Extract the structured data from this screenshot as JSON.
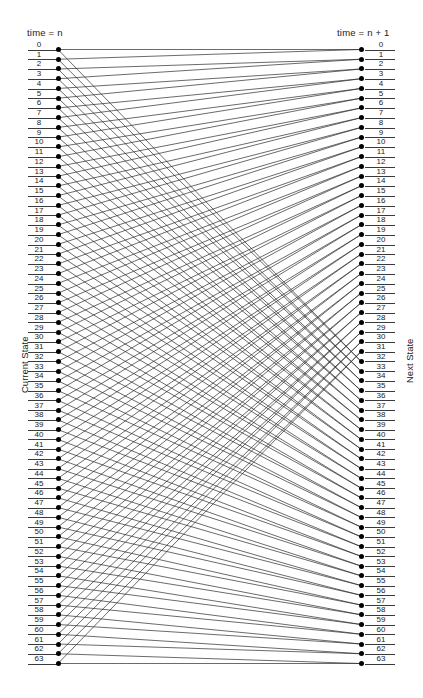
{
  "figure": {
    "headers": {
      "left": "time = n",
      "right": "time = n + 1"
    },
    "axis_titles": {
      "left": "Current State",
      "right": "Next State"
    },
    "footnote": ""
  },
  "chart_data": {
    "type": "diagram",
    "title": "",
    "subtitle": "",
    "xlabel": "",
    "ylabel": "Current State",
    "y2label": "Next State",
    "grid": false,
    "legend": null,
    "node_count": 64,
    "left_column_label": "time = n",
    "right_column_label": "time = n + 1",
    "left_tick_labels": [
      "0",
      "1",
      "2",
      "3",
      "4",
      "5",
      "6",
      "7",
      "8",
      "9",
      "10",
      "11",
      "12",
      "13",
      "14",
      "15",
      "16",
      "17",
      "18",
      "19",
      "20",
      "21",
      "22",
      "23",
      "24",
      "25",
      "26",
      "27",
      "28",
      "29",
      "30",
      "31",
      "32",
      "33",
      "34",
      "35",
      "36",
      "37",
      "38",
      "39",
      "40",
      "41",
      "42",
      "43",
      "44",
      "45",
      "46",
      "47",
      "48",
      "49",
      "50",
      "51",
      "52",
      "53",
      "54",
      "55",
      "56",
      "57",
      "58",
      "59",
      "60",
      "61",
      "62",
      "63"
    ],
    "right_tick_labels": [
      "0",
      "1",
      "2",
      "3",
      "4",
      "5",
      "6",
      "7",
      "8",
      "9",
      "10",
      "11",
      "12",
      "13",
      "14",
      "15",
      "16",
      "17",
      "18",
      "19",
      "20",
      "21",
      "22",
      "23",
      "24",
      "25",
      "26",
      "27",
      "28",
      "29",
      "30",
      "31",
      "32",
      "33",
      "34",
      "35",
      "36",
      "37",
      "38",
      "39",
      "40",
      "41",
      "42",
      "43",
      "44",
      "45",
      "46",
      "47",
      "48",
      "49",
      "50",
      "51",
      "52",
      "53",
      "54",
      "55",
      "56",
      "57",
      "58",
      "59",
      "60",
      "61",
      "62",
      "63"
    ],
    "edges_per_node": 2,
    "transition_rule": "next = floor(current / 2) and next = floor(current / 2) + 32",
    "edges": [
      [
        0,
        0
      ],
      [
        0,
        32
      ],
      [
        1,
        0
      ],
      [
        1,
        32
      ],
      [
        2,
        1
      ],
      [
        2,
        33
      ],
      [
        3,
        1
      ],
      [
        3,
        33
      ],
      [
        4,
        2
      ],
      [
        4,
        34
      ],
      [
        5,
        2
      ],
      [
        5,
        34
      ],
      [
        6,
        3
      ],
      [
        6,
        35
      ],
      [
        7,
        3
      ],
      [
        7,
        35
      ],
      [
        8,
        4
      ],
      [
        8,
        36
      ],
      [
        9,
        4
      ],
      [
        9,
        36
      ],
      [
        10,
        5
      ],
      [
        10,
        37
      ],
      [
        11,
        5
      ],
      [
        11,
        37
      ],
      [
        12,
        6
      ],
      [
        12,
        38
      ],
      [
        13,
        6
      ],
      [
        13,
        38
      ],
      [
        14,
        7
      ],
      [
        14,
        39
      ],
      [
        15,
        7
      ],
      [
        15,
        39
      ],
      [
        16,
        8
      ],
      [
        16,
        40
      ],
      [
        17,
        8
      ],
      [
        17,
        40
      ],
      [
        18,
        9
      ],
      [
        18,
        41
      ],
      [
        19,
        9
      ],
      [
        19,
        41
      ],
      [
        20,
        10
      ],
      [
        20,
        42
      ],
      [
        21,
        10
      ],
      [
        21,
        42
      ],
      [
        22,
        11
      ],
      [
        22,
        43
      ],
      [
        23,
        11
      ],
      [
        23,
        43
      ],
      [
        24,
        12
      ],
      [
        24,
        44
      ],
      [
        25,
        12
      ],
      [
        25,
        44
      ],
      [
        26,
        13
      ],
      [
        26,
        45
      ],
      [
        27,
        13
      ],
      [
        27,
        45
      ],
      [
        28,
        14
      ],
      [
        28,
        46
      ],
      [
        29,
        14
      ],
      [
        29,
        46
      ],
      [
        30,
        15
      ],
      [
        30,
        47
      ],
      [
        31,
        15
      ],
      [
        31,
        47
      ],
      [
        32,
        16
      ],
      [
        32,
        48
      ],
      [
        33,
        16
      ],
      [
        33,
        48
      ],
      [
        34,
        17
      ],
      [
        34,
        49
      ],
      [
        35,
        17
      ],
      [
        35,
        49
      ],
      [
        36,
        18
      ],
      [
        36,
        50
      ],
      [
        37,
        18
      ],
      [
        37,
        50
      ],
      [
        38,
        19
      ],
      [
        38,
        51
      ],
      [
        39,
        19
      ],
      [
        39,
        51
      ],
      [
        40,
        20
      ],
      [
        40,
        52
      ],
      [
        41,
        20
      ],
      [
        41,
        52
      ],
      [
        42,
        21
      ],
      [
        42,
        53
      ],
      [
        43,
        21
      ],
      [
        43,
        53
      ],
      [
        44,
        22
      ],
      [
        44,
        54
      ],
      [
        45,
        22
      ],
      [
        45,
        54
      ],
      [
        46,
        23
      ],
      [
        46,
        55
      ],
      [
        47,
        23
      ],
      [
        47,
        55
      ],
      [
        48,
        24
      ],
      [
        48,
        56
      ],
      [
        49,
        24
      ],
      [
        49,
        56
      ],
      [
        50,
        25
      ],
      [
        50,
        57
      ],
      [
        51,
        25
      ],
      [
        51,
        57
      ],
      [
        52,
        26
      ],
      [
        52,
        58
      ],
      [
        53,
        26
      ],
      [
        53,
        58
      ],
      [
        54,
        27
      ],
      [
        54,
        59
      ],
      [
        55,
        27
      ],
      [
        55,
        59
      ],
      [
        56,
        28
      ],
      [
        56,
        60
      ],
      [
        57,
        28
      ],
      [
        57,
        60
      ],
      [
        58,
        29
      ],
      [
        58,
        61
      ],
      [
        59,
        29
      ],
      [
        59,
        61
      ],
      [
        60,
        30
      ],
      [
        60,
        62
      ],
      [
        61,
        30
      ],
      [
        61,
        62
      ],
      [
        62,
        31
      ],
      [
        62,
        63
      ],
      [
        63,
        31
      ],
      [
        63,
        63
      ]
    ]
  },
  "geometry": {
    "left_node_x": 58,
    "right_node_x": 361,
    "first_row_y": 46,
    "row_spacing": 9.746,
    "left_label_x": 30,
    "right_label_x": 368,
    "rule_width": 30,
    "edge_color": "#2b2b2b",
    "node_color": "#000000"
  }
}
